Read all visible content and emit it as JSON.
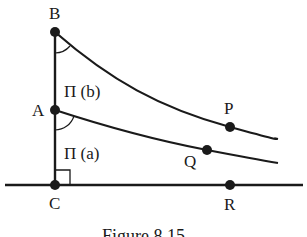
{
  "figure": {
    "caption": "Figure 8.15",
    "points": {
      "B": "B",
      "A": "A",
      "C": "C",
      "P": "P",
      "Q": "Q",
      "R": "R"
    },
    "angle_labels": {
      "upper": "Π (b)",
      "lower": "Π (a)"
    },
    "colors": {
      "ink": "#1a1a1a",
      "background": "#ffffff"
    }
  }
}
